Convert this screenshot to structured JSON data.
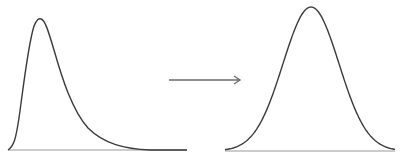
{
  "diagram": {
    "left_curve": {
      "name": "skewed-distribution",
      "shape": "right-skewed",
      "peak": [
        41,
        19
      ],
      "baseline": {
        "x1": 8,
        "x2": 187,
        "y": 150
      }
    },
    "arrow": {
      "name": "transform-arrow",
      "direction": "right",
      "from": [
        169,
        80
      ],
      "to": [
        240,
        80
      ]
    },
    "right_curve": {
      "name": "normal-distribution",
      "shape": "symmetric-bell",
      "peak": [
        311,
        7
      ],
      "baseline": {
        "x1": 225,
        "x2": 395,
        "y": 151
      }
    },
    "colors": {
      "curve": "#3a3a3a",
      "baseline": "#9a9a9a",
      "arrow": "#6a6a6a",
      "background": "#ffffff"
    }
  }
}
